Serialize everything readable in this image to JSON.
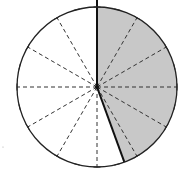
{
  "diagram": {
    "type": "circle-sector",
    "center": [
      97,
      87
    ],
    "radius": 80,
    "divisions": 12,
    "division_angle_deg": 30,
    "tick_count": 24,
    "shaded_sector": {
      "start_deg": 0,
      "end_deg": 160,
      "direction": "clockwise-from-top"
    },
    "colors": {
      "background": "#ffffff",
      "outline": "#222222",
      "shade": "#c8c8c8",
      "dashed": "#333333"
    }
  }
}
